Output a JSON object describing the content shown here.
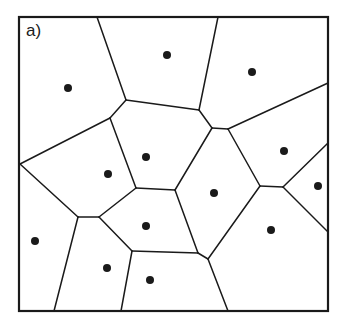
{
  "figure": {
    "panel_label": "a)",
    "type": "voronoi-diagram",
    "stroke_color": "#1a1a1a",
    "background": "#ffffff",
    "bounding_box": {
      "x1": 19,
      "y1": 17,
      "x2": 328,
      "y2": 311
    },
    "sites": [
      [
        68,
        88
      ],
      [
        167,
        55
      ],
      [
        252,
        72
      ],
      [
        146,
        157
      ],
      [
        108,
        174
      ],
      [
        284,
        151
      ],
      [
        214,
        193
      ],
      [
        318,
        186
      ],
      [
        146,
        226
      ],
      [
        35,
        241
      ],
      [
        107,
        268
      ],
      [
        271,
        230
      ],
      [
        150,
        280
      ]
    ],
    "edges": [
      [
        [
          97,
          17
        ],
        [
          126,
          100
        ]
      ],
      [
        [
          218,
          17
        ],
        [
          199,
          110
        ]
      ],
      [
        [
          126,
          100
        ],
        [
          110,
          118
        ]
      ],
      [
        [
          126,
          100
        ],
        [
          199,
          110
        ]
      ],
      [
        [
          199,
          110
        ],
        [
          212,
          128
        ]
      ],
      [
        [
          212,
          128
        ],
        [
          228,
          129
        ]
      ],
      [
        [
          228,
          129
        ],
        [
          328,
          83
        ]
      ],
      [
        [
          110,
          118
        ],
        [
          20,
          164
        ]
      ],
      [
        [
          110,
          118
        ],
        [
          136,
          188
        ]
      ],
      [
        [
          212,
          128
        ],
        [
          175,
          190
        ]
      ],
      [
        [
          136,
          188
        ],
        [
          175,
          190
        ]
      ],
      [
        [
          228,
          129
        ],
        [
          260,
          186
        ]
      ],
      [
        [
          260,
          186
        ],
        [
          283,
          187
        ]
      ],
      [
        [
          283,
          187
        ],
        [
          328,
          143
        ]
      ],
      [
        [
          283,
          187
        ],
        [
          328,
          232
        ]
      ],
      [
        [
          175,
          190
        ],
        [
          198,
          253
        ]
      ],
      [
        [
          260,
          186
        ],
        [
          208,
          259
        ]
      ],
      [
        [
          198,
          253
        ],
        [
          208,
          259
        ]
      ],
      [
        [
          208,
          259
        ],
        [
          228,
          311
        ]
      ],
      [
        [
          136,
          188
        ],
        [
          99,
          217
        ]
      ],
      [
        [
          20,
          164
        ],
        [
          78,
          217
        ]
      ],
      [
        [
          78,
          217
        ],
        [
          99,
          217
        ]
      ],
      [
        [
          78,
          217
        ],
        [
          54,
          311
        ]
      ],
      [
        [
          99,
          217
        ],
        [
          132,
          251
        ]
      ],
      [
        [
          132,
          251
        ],
        [
          198,
          253
        ]
      ],
      [
        [
          132,
          251
        ],
        [
          121,
          311
        ]
      ]
    ]
  }
}
